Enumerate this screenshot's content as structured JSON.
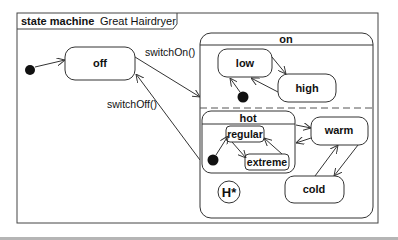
{
  "frame": {
    "keyword": "state machine",
    "name": "Great Hairdryer"
  },
  "states": {
    "off": "off",
    "on": "on",
    "low": "low",
    "high": "high",
    "hot": "hot",
    "regular": "regular",
    "extreme": "extreme",
    "warm": "warm",
    "cold": "cold",
    "history": "H*"
  },
  "transitions": {
    "switch_on": "switchOn()",
    "switch_off": "switchOff()"
  },
  "colors": {
    "line": "#333333",
    "initial_dot": "#111111",
    "footer_band": "#b5b5b5"
  }
}
